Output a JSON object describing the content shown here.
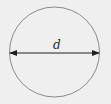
{
  "diagram": {
    "label": "d",
    "colors": {
      "background": "#efefef",
      "circle_stroke": "#8a8a8a",
      "diameter_line": "#1e1e1e"
    },
    "circle": {
      "cx": 54.5,
      "cy": 52,
      "r": 45
    },
    "diameter": {
      "x1": 10,
      "x2": 99,
      "y": 53
    }
  }
}
